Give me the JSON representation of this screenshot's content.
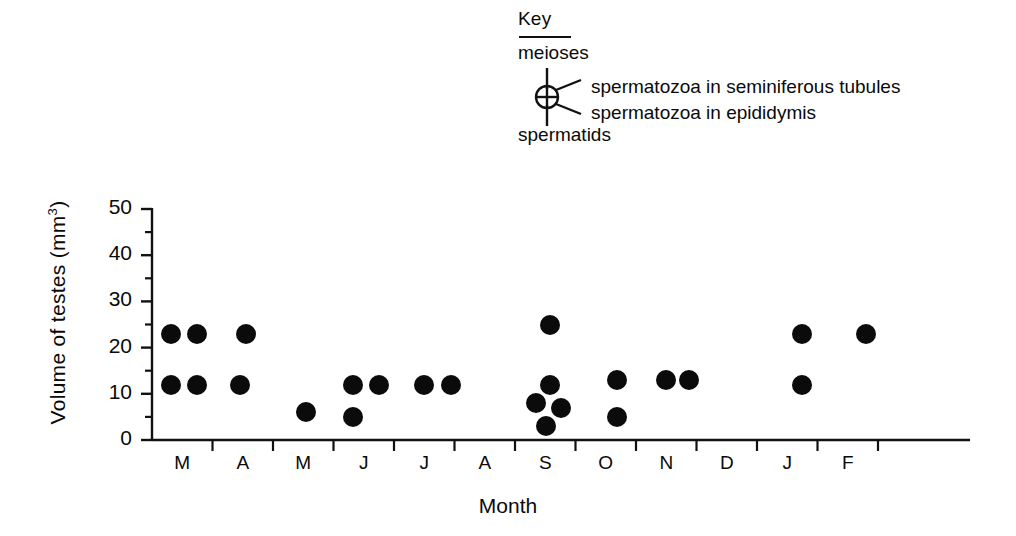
{
  "key": {
    "title": "Key",
    "top_label": "meioses",
    "bottom_label": "spermatids",
    "right_upper_label": "spermatozoa in seminiferous tubules",
    "right_lower_label": "spermatozoa in epididymis",
    "symbol_name": "circle-with-cross-and-four-radiating-lines"
  },
  "axes": {
    "ylabel_text": "Volume of testes  (mm",
    "ylabel_sup": "3",
    "ylabel_tail": ")",
    "xlabel": "Month"
  },
  "chart_data": {
    "type": "scatter",
    "title": "",
    "xlabel": "Month",
    "ylabel": "Volume of testes (mm3)",
    "ylim": [
      0,
      50
    ],
    "yticks": [
      0,
      10,
      20,
      30,
      40,
      50
    ],
    "ytick_labels": [
      "0",
      "10",
      "20",
      "30",
      "40",
      "50"
    ],
    "y_minor_ticks": [
      5,
      15,
      25,
      35,
      45
    ],
    "grid": false,
    "legend_position": "top-center",
    "categories": [
      "M",
      "A",
      "M",
      "J",
      "J",
      "A",
      "S",
      "O",
      "N",
      "D",
      "J",
      "F"
    ],
    "category_names": [
      "March",
      "April",
      "May",
      "June",
      "July",
      "August",
      "September",
      "October",
      "November",
      "December",
      "January",
      "February"
    ],
    "marker": "filled-circle",
    "marker_color": "#0b0b0b",
    "points": [
      {
        "month": "M",
        "month_index": 0,
        "x_offset": -0.18,
        "value": 23
      },
      {
        "month": "M",
        "month_index": 0,
        "x_offset": 0.25,
        "value": 23
      },
      {
        "month": "M",
        "month_index": 0,
        "x_offset": -0.18,
        "value": 12
      },
      {
        "month": "M",
        "month_index": 0,
        "x_offset": 0.25,
        "value": 12
      },
      {
        "month": "A",
        "month_index": 1,
        "x_offset": 0.05,
        "value": 23
      },
      {
        "month": "A",
        "month_index": 1,
        "x_offset": -0.05,
        "value": 12
      },
      {
        "month": "M",
        "month_index": 2,
        "x_offset": 0.05,
        "value": 6
      },
      {
        "month": "J",
        "month_index": 3,
        "x_offset": -0.18,
        "value": 12
      },
      {
        "month": "J",
        "month_index": 3,
        "x_offset": 0.25,
        "value": 12
      },
      {
        "month": "J",
        "month_index": 3,
        "x_offset": -0.18,
        "value": 5
      },
      {
        "month": "J",
        "month_index": 4,
        "x_offset": 0.0,
        "value": 12
      },
      {
        "month": "J",
        "month_index": 4,
        "x_offset": 0.45,
        "value": 12
      },
      {
        "month": "S",
        "month_index": 6,
        "x_offset": 0.08,
        "value": 25
      },
      {
        "month": "S",
        "month_index": 6,
        "x_offset": 0.08,
        "value": 12
      },
      {
        "month": "S",
        "month_index": 6,
        "x_offset": -0.16,
        "value": 8
      },
      {
        "month": "S",
        "month_index": 6,
        "x_offset": 0.26,
        "value": 7
      },
      {
        "month": "S",
        "month_index": 6,
        "x_offset": 0.02,
        "value": 3
      },
      {
        "month": "O",
        "month_index": 7,
        "x_offset": 0.18,
        "value": 13
      },
      {
        "month": "O",
        "month_index": 7,
        "x_offset": 0.18,
        "value": 5
      },
      {
        "month": "N",
        "month_index": 8,
        "x_offset": 0.0,
        "value": 13
      },
      {
        "month": "N",
        "month_index": 8,
        "x_offset": 0.38,
        "value": 13
      },
      {
        "month": "J",
        "month_index": 10,
        "x_offset": 0.25,
        "value": 23
      },
      {
        "month": "J",
        "month_index": 10,
        "x_offset": 0.25,
        "value": 12
      },
      {
        "month": "F",
        "month_index": 11,
        "x_offset": 0.3,
        "value": 23
      }
    ]
  },
  "geometry": {
    "x_origin_px": 152,
    "x_step_px": 60.5,
    "y_zero_px": 440,
    "y_top_px": 209,
    "y_max_value": 50,
    "dot_diameter_px": 20,
    "axis_right_px": 970
  }
}
